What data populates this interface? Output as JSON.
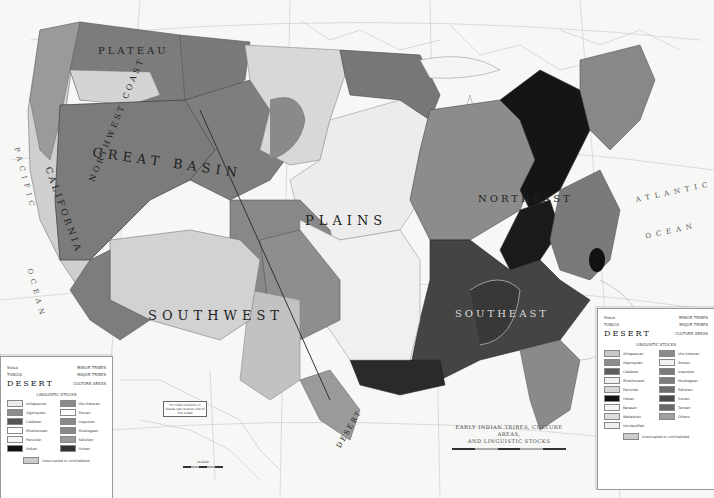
{
  "map": {
    "title": "EARLY INDIAN TRIBES, CULTURE AREAS, AND LINGUISTIC STOCKS",
    "title_line1": "EARLY INDIAN TRIBES, CULTURE AREAS,",
    "title_line2": "AND LINGUISTIC STOCKS",
    "culture_areas": [
      {
        "id": "northwest-coast",
        "label": "NORTHWEST COAST"
      },
      {
        "id": "plateau",
        "label": "PLATEAU"
      },
      {
        "id": "great-basin",
        "label": "GREAT BASIN"
      },
      {
        "id": "california",
        "label": "CALIFORNIA"
      },
      {
        "id": "plains",
        "label": "PLAINS"
      },
      {
        "id": "southwest",
        "label": "SOUTHWEST"
      },
      {
        "id": "northeast",
        "label": "NORTHEAST"
      },
      {
        "id": "southeast",
        "label": "SOUTHEAST"
      },
      {
        "id": "desert",
        "label": "DESERT"
      }
    ],
    "oceans": [
      {
        "id": "atlantic",
        "line1": "ATLANTIC",
        "line2": "OCEAN"
      },
      {
        "id": "pacific",
        "line1": "PACIFIC",
        "line2": "OCEAN"
      }
    ],
    "tribe_labels": [
      "NEZ PERCE",
      "SHOSHONI",
      "PAIUTE",
      "UTE",
      "BLACKFOOT",
      "ASSINIBOIN",
      "CROW",
      "TETON",
      "ARAPAHO",
      "CHEYENNE",
      "PAWNEE",
      "OMAHA",
      "OSAGE",
      "KIOWA",
      "COMANCHE",
      "APACHE",
      "NAVAHO",
      "HOPI",
      "PIMA",
      "ILLINOIS",
      "MIAMI",
      "SHAWNEE",
      "CHEROKEE",
      "CREEK",
      "CHOCTAW",
      "CHICKASAW",
      "NATCHEZ",
      "IROQUOIS",
      "ALGONKIN",
      "ABNAKI",
      "CHIPPEWA",
      "SIOUX",
      "DAKOTA",
      "MANDAN",
      "ARIKARA",
      "CADDO",
      "WICHITA",
      "LAKE SUPERIOR",
      "LAKE MICHIGAN"
    ],
    "alaska_note": "For tribal locations in Alaska see reverse side of this sheet",
    "alaska_label": "ALASKA"
  },
  "legend_right": {
    "rows": [
      {
        "left": "Sioux",
        "right": "MINOR TRIBES"
      },
      {
        "left": "TUNICA",
        "right": "MAJOR TRIBES"
      },
      {
        "left": "DESERT",
        "right": "CULTURE AREAS"
      }
    ],
    "stocks_title": "LINGUISTIC STOCKS",
    "stocks": [
      {
        "name": "Athapascan",
        "color": "#c9c9c9"
      },
      {
        "name": "Uto-Aztecan",
        "color": "#8a8a8a"
      },
      {
        "name": "Algonquian",
        "color": "#8d8d8d"
      },
      {
        "name": "Siouan",
        "color": "#f2f2f2"
      },
      {
        "name": "Caddoan",
        "color": "#5d5d5d"
      },
      {
        "name": "Iroquoian",
        "color": "#7a7a7a"
      },
      {
        "name": "Shoshonean",
        "color": "#f0f0f0"
      },
      {
        "name": "Muskogean",
        "color": "#7d7d7d"
      },
      {
        "name": "Penutian",
        "color": "#d6d6d6"
      },
      {
        "name": "Salishan",
        "color": "#6d6d6d"
      },
      {
        "name": "Hokan",
        "color": "#111111"
      },
      {
        "name": "Yuman",
        "color": "#4a4a4a"
      },
      {
        "name": "Keresan",
        "color": "#f5f5f5"
      },
      {
        "name": "Tanoan",
        "color": "#6a6a6a"
      },
      {
        "name": "Wakashan",
        "color": "#dcdcdc"
      },
      {
        "name": "Others",
        "color": "#a0a0a0"
      },
      {
        "name": "Unclassified",
        "color": "#efefef"
      }
    ],
    "uninhabited": "Unoccupied or uninhabited"
  },
  "legend_left": {
    "rows": [
      {
        "left": "Sioux",
        "right": "MINOR TRIBES"
      },
      {
        "left": "TUNICA",
        "right": "MAJOR TRIBES"
      },
      {
        "left": "DESERT",
        "right": "CULTURE AREAS"
      }
    ],
    "stocks_title": "LINGUISTIC STOCKS"
  }
}
